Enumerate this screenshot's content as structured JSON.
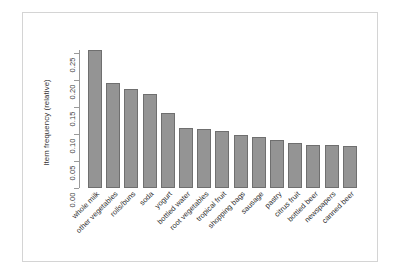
{
  "figure": {
    "title": "",
    "y_axis_title": "Item frequency (relative)",
    "x_axis_title": "",
    "frame_color": "#d4d4d4",
    "bar_fill_color": "#949494",
    "bar_border_color": "#6f6f6f",
    "axis_color": "#9a9a9a"
  },
  "chart_data": {
    "type": "bar",
    "title": "",
    "xlabel": "",
    "ylabel": "Item frequency (relative)",
    "ylim": [
      0.0,
      0.26
    ],
    "yticks": [
      "0.00",
      "0.05",
      "0.10",
      "0.15",
      "0.20",
      "0.25"
    ],
    "ytick_values": [
      0.0,
      0.05,
      0.1,
      0.15,
      0.2,
      0.25
    ],
    "grid": false,
    "legend": null,
    "orientation": "vertical",
    "categories": [
      "whole milk",
      "other vegetables",
      "rolls/buns",
      "soda",
      "yogurt",
      "bottled water",
      "root vegetables",
      "tropical fruit",
      "shopping bags",
      "sausage",
      "pastry",
      "citrus fruit",
      "bottled beer",
      "newspapers",
      "canned beer"
    ],
    "values": [
      0.2555,
      0.1935,
      0.1839,
      0.1743,
      0.1395,
      0.1105,
      0.1089,
      0.1049,
      0.0985,
      0.094,
      0.0889,
      0.0828,
      0.0805,
      0.0798,
      0.0777
    ]
  }
}
